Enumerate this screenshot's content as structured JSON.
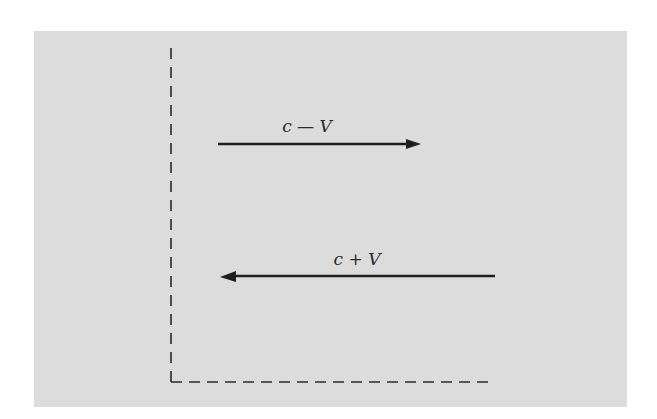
{
  "diagram": {
    "background_color": "#dcdcdc",
    "line_color": "#1e1e1e",
    "arrows": [
      {
        "id": "upper",
        "label": "c — V",
        "direction": "right"
      },
      {
        "id": "lower",
        "label": "c + V",
        "direction": "left"
      }
    ],
    "axes": {
      "vertical": "dashed",
      "horizontal": "dashed"
    }
  }
}
